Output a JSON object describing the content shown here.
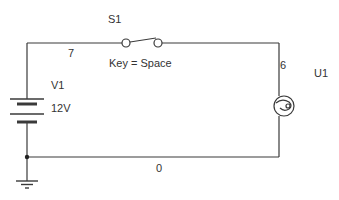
{
  "diagram": {
    "type": "circuit-schematic",
    "colors": {
      "wire": "#3a3a3a",
      "text": "#333333",
      "background": "#ffffff"
    },
    "components": {
      "switch": {
        "ref": "S1",
        "key_label": "Key = Space"
      },
      "battery": {
        "ref": "V1",
        "value": "12V"
      },
      "lamp": {
        "ref": "U1"
      },
      "ground": {
        "symbol": "ground-icon"
      }
    },
    "nodes": {
      "top_left": "7",
      "top_right": "6",
      "bottom": "0"
    }
  }
}
